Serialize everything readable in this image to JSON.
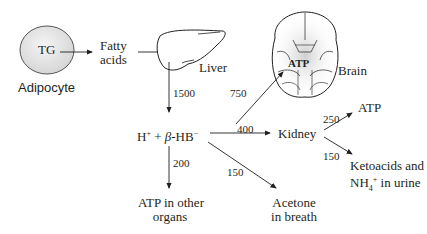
{
  "nodes": {
    "tg": "TG",
    "adipocyte": "Adipocyte",
    "fatty_acids": [
      "Fatty",
      "acids"
    ],
    "liver": "Liver",
    "brain": "Brain",
    "brain_atp": "ATP",
    "hplus": "H",
    "hplus_sup": "+",
    "plus": "+",
    "beta": "β",
    "hb": "-HB",
    "hb_sup": "−",
    "kidney": "Kidney",
    "kidney_atp": "ATP",
    "ketoacids": [
      "Ketoacids and",
      "NH"
    ],
    "nh4_sub": "4",
    "nh4_sup": "+",
    "urine": " in urine",
    "atp_other": [
      "ATP in other",
      "organs"
    ],
    "acetone": [
      "Acetone",
      "in breath"
    ]
  },
  "flows": {
    "liver_to_hb": "1500",
    "hb_to_brain": "750",
    "hb_to_kidney": "400",
    "hb_to_other": "200",
    "hb_to_acetone": "150",
    "kidney_to_atp": "250",
    "kidney_to_urine": "150"
  },
  "colors": {
    "line": "#231f20",
    "cell_fill": "#e6e6e6",
    "brain_glow": "#d9d9d9"
  }
}
